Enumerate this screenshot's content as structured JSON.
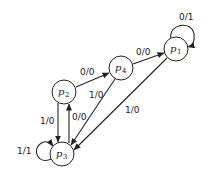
{
  "diagram": {
    "type": "state-transition-diagram",
    "states": [
      {
        "id": "p1",
        "name": "p",
        "sub": "1",
        "cx": 176,
        "cy": 49
      },
      {
        "id": "p4",
        "name": "p",
        "sub": "4",
        "cx": 121,
        "cy": 68
      },
      {
        "id": "p2",
        "name": "p",
        "sub": "2",
        "cx": 64,
        "cy": 92
      },
      {
        "id": "p3",
        "name": "p",
        "sub": "3",
        "cx": 62,
        "cy": 154
      }
    ],
    "transitions": [
      {
        "from": "p1",
        "to": "p1",
        "label": "0/1"
      },
      {
        "from": "p4",
        "to": "p1",
        "label": "0/0"
      },
      {
        "from": "p2",
        "to": "p4",
        "label": "0/0"
      },
      {
        "from": "p4",
        "to": "p3",
        "label": "1/0"
      },
      {
        "from": "p1",
        "to": "p3",
        "label": "1/0"
      },
      {
        "from": "p2",
        "to": "p3",
        "label": "1/0"
      },
      {
        "from": "p3",
        "to": "p2",
        "label": "0/0"
      },
      {
        "from": "p3",
        "to": "p3",
        "label": "1/1"
      }
    ]
  }
}
